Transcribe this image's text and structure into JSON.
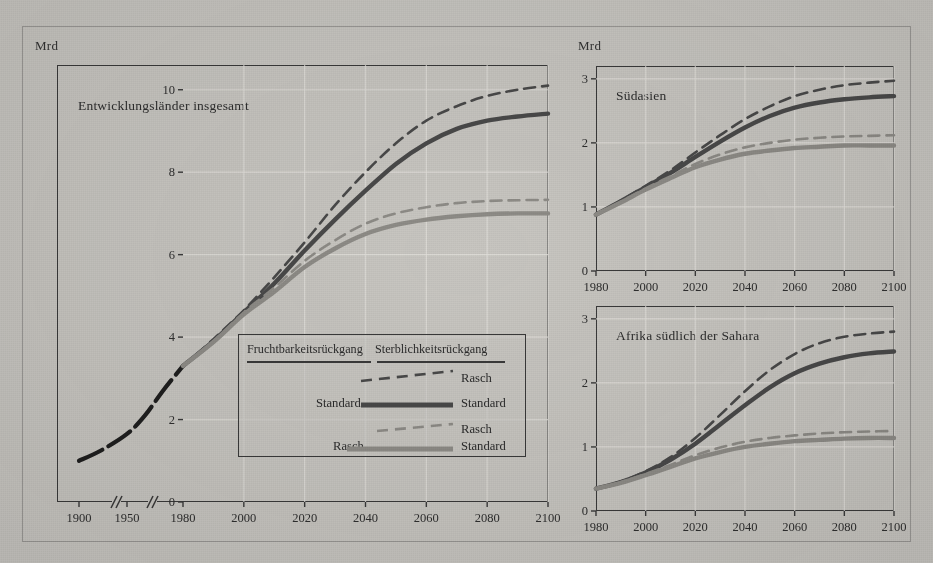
{
  "figure": {
    "background_color": "#c9c7c2",
    "ink_color": "#3a3a3a",
    "series_colors": {
      "dark": "#4a4a4a",
      "light": "#8f8d88",
      "historical": "#1f1f1f"
    }
  },
  "panels": {
    "main": {
      "axis_unit": "Mrd",
      "title": "Entwicklungsländer insgesamt",
      "y_ticks": [
        "0",
        "2",
        "4",
        "6",
        "8",
        "10"
      ],
      "x_ticks": [
        "1900",
        "1950",
        "1980",
        "2000",
        "2020",
        "2040",
        "2060",
        "2080",
        "2100"
      ],
      "has_axis_break": true
    },
    "south_asia": {
      "axis_unit": "Mrd",
      "title": "Südasien",
      "y_ticks": [
        "0",
        "1",
        "2",
        "3"
      ],
      "x_ticks": [
        "1980",
        "2000",
        "2020",
        "2040",
        "2060",
        "2080",
        "2100"
      ]
    },
    "africa": {
      "title": "Afrika südlich der Sahara",
      "y_ticks": [
        "0",
        "1",
        "2",
        "3"
      ],
      "x_ticks": [
        "1980",
        "2000",
        "2020",
        "2040",
        "2060",
        "2080",
        "2100"
      ]
    }
  },
  "legend": {
    "header_left": "Fruchtbarkeitsrückgang",
    "header_right": "Sterblichkeitsrückgang",
    "rows": [
      {
        "left_label": "",
        "right_label": "Rasch",
        "style": "dashed",
        "tone": "dark"
      },
      {
        "left_label": "Standard",
        "right_label": "Standard",
        "style": "solid",
        "tone": "dark"
      },
      {
        "left_label": "",
        "right_label": "Rasch",
        "style": "dashed",
        "tone": "light"
      },
      {
        "left_label": "Rasch",
        "right_label": "Standard",
        "style": "solid",
        "tone": "light"
      }
    ]
  },
  "chart_data": [
    {
      "type": "line",
      "title": "Entwicklungsländer insgesamt",
      "xlabel": "",
      "ylabel": "Mrd",
      "xlim": [
        1980,
        2100
      ],
      "ylim": [
        0,
        10.6
      ],
      "grid": true,
      "axis_break_segments": [
        "1900-1950",
        "1950-1980"
      ],
      "historical": {
        "name": "Historisch (gestrichelt/fett schwarz)",
        "x": [
          1900,
          1925,
          1950,
          1960,
          1970,
          1980
        ],
        "values": [
          1.0,
          1.25,
          1.65,
          2.1,
          2.7,
          3.3
        ]
      },
      "x": [
        1980,
        1990,
        2000,
        2010,
        2020,
        2030,
        2040,
        2050,
        2060,
        2070,
        2080,
        2090,
        2100
      ],
      "series": [
        {
          "name": "Fruchtbarkeit Standard / Sterblichkeit Rasch",
          "style": "dashed",
          "tone": "dark",
          "values": [
            3.3,
            3.95,
            4.65,
            5.45,
            6.3,
            7.2,
            8.0,
            8.7,
            9.25,
            9.6,
            9.85,
            10.0,
            10.1
          ]
        },
        {
          "name": "Fruchtbarkeit Standard / Sterblichkeit Standard",
          "style": "solid",
          "tone": "dark",
          "values": [
            3.3,
            3.9,
            4.6,
            5.3,
            6.1,
            6.85,
            7.55,
            8.2,
            8.7,
            9.05,
            9.25,
            9.35,
            9.42
          ]
        },
        {
          "name": "Fruchtbarkeit Rasch / Sterblichkeit Rasch",
          "style": "dashed",
          "tone": "light",
          "values": [
            3.3,
            3.9,
            4.6,
            5.2,
            5.85,
            6.35,
            6.75,
            7.0,
            7.15,
            7.25,
            7.3,
            7.32,
            7.33
          ]
        },
        {
          "name": "Fruchtbarkeit Rasch / Sterblichkeit Standard",
          "style": "solid",
          "tone": "light",
          "values": [
            3.3,
            3.88,
            4.55,
            5.1,
            5.7,
            6.15,
            6.5,
            6.72,
            6.85,
            6.93,
            6.98,
            7.0,
            7.0
          ]
        }
      ]
    },
    {
      "type": "line",
      "title": "Südasien",
      "xlabel": "",
      "ylabel": "Mrd",
      "xlim": [
        1980,
        2100
      ],
      "ylim": [
        0,
        3.2
      ],
      "grid": true,
      "x": [
        1980,
        1990,
        2000,
        2010,
        2020,
        2030,
        2040,
        2050,
        2060,
        2070,
        2080,
        2090,
        2100
      ],
      "series": [
        {
          "name": "Fruchtbarkeit Standard / Sterblichkeit Rasch",
          "style": "dashed",
          "tone": "dark",
          "values": [
            0.88,
            1.1,
            1.33,
            1.57,
            1.85,
            2.12,
            2.37,
            2.57,
            2.73,
            2.83,
            2.9,
            2.94,
            2.97
          ]
        },
        {
          "name": "Fruchtbarkeit Standard / Sterblichkeit Standard",
          "style": "solid",
          "tone": "dark",
          "values": [
            0.88,
            1.09,
            1.31,
            1.53,
            1.78,
            2.02,
            2.24,
            2.42,
            2.55,
            2.63,
            2.68,
            2.71,
            2.73
          ]
        },
        {
          "name": "Fruchtbarkeit Rasch / Sterblichkeit Rasch",
          "style": "dashed",
          "tone": "light",
          "values": [
            0.88,
            1.08,
            1.29,
            1.48,
            1.67,
            1.82,
            1.93,
            2.0,
            2.05,
            2.08,
            2.1,
            2.11,
            2.12
          ]
        },
        {
          "name": "Fruchtbarkeit Rasch / Sterblichkeit Standard",
          "style": "solid",
          "tone": "light",
          "values": [
            0.88,
            1.07,
            1.27,
            1.45,
            1.62,
            1.74,
            1.83,
            1.88,
            1.92,
            1.94,
            1.96,
            1.96,
            1.96
          ]
        }
      ]
    },
    {
      "type": "line",
      "title": "Afrika südlich der Sahara",
      "xlabel": "",
      "ylabel": "",
      "xlim": [
        1980,
        2100
      ],
      "ylim": [
        0,
        3.2
      ],
      "grid": true,
      "x": [
        1980,
        1990,
        2000,
        2010,
        2020,
        2030,
        2040,
        2050,
        2060,
        2070,
        2080,
        2090,
        2100
      ],
      "series": [
        {
          "name": "Fruchtbarkeit Standard / Sterblichkeit Rasch",
          "style": "dashed",
          "tone": "dark",
          "values": [
            0.35,
            0.46,
            0.62,
            0.84,
            1.14,
            1.5,
            1.87,
            2.2,
            2.45,
            2.62,
            2.72,
            2.77,
            2.8
          ]
        },
        {
          "name": "Fruchtbarkeit Standard / Sterblichkeit Standard",
          "style": "solid",
          "tone": "dark",
          "values": [
            0.35,
            0.45,
            0.6,
            0.8,
            1.05,
            1.35,
            1.65,
            1.93,
            2.15,
            2.3,
            2.4,
            2.46,
            2.49
          ]
        },
        {
          "name": "Fruchtbarkeit Rasch / Sterblichkeit Rasch",
          "style": "dashed",
          "tone": "light",
          "values": [
            0.35,
            0.45,
            0.58,
            0.72,
            0.87,
            0.99,
            1.08,
            1.14,
            1.18,
            1.21,
            1.23,
            1.24,
            1.25
          ]
        },
        {
          "name": "Fruchtbarkeit Rasch / Sterblichkeit Standard",
          "style": "solid",
          "tone": "light",
          "values": [
            0.35,
            0.44,
            0.56,
            0.69,
            0.82,
            0.92,
            1.0,
            1.05,
            1.09,
            1.11,
            1.13,
            1.14,
            1.14
          ]
        }
      ]
    }
  ]
}
